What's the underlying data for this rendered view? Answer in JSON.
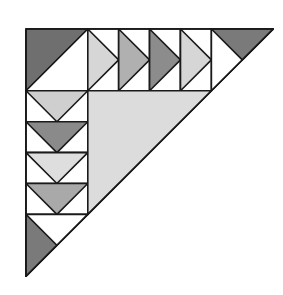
{
  "diagram": {
    "type": "quilt-block-flying-geese-triangle",
    "origin": [
      26,
      29
    ],
    "unit": 30.9,
    "colors": {
      "stroke": "#1a1a1a",
      "white": "#ffffff",
      "corner_dark": "#6f6f6f",
      "center_light": "#dcdcdc"
    },
    "corner_square": {
      "fill": "#6f6f6f"
    },
    "top_geese": [
      {
        "fill": "#d6d6d6"
      },
      {
        "fill": "#b0b0b0"
      },
      {
        "fill": "#8c8c8c"
      },
      {
        "fill": "#d6d6d6"
      }
    ],
    "top_end_triangle": {
      "fill": "#7a7a7a"
    },
    "left_geese": [
      {
        "fill": "#cfcfcf"
      },
      {
        "fill": "#8a8a8a"
      },
      {
        "fill": "#dedede"
      },
      {
        "fill": "#a9a9a9"
      }
    ],
    "bottom_end_triangle": {
      "fill": "#7a7a7a"
    },
    "center_triangle": {
      "fill": "#dcdcdc"
    }
  }
}
